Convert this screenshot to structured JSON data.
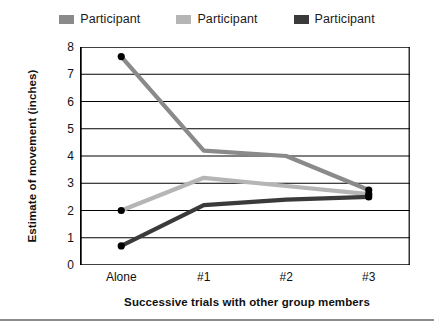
{
  "chart_data": {
    "type": "line",
    "title": "",
    "xlabel": "Successive trials with other group members",
    "ylabel": "Estimate of movement (inches)",
    "categories": [
      "Alone",
      "#1",
      "#2",
      "#3"
    ],
    "ylim": [
      0,
      8
    ],
    "yticks": [
      "0",
      "1",
      "2",
      "3",
      "4",
      "5",
      "6",
      "7",
      "8"
    ],
    "grid": true,
    "legend_position": "top",
    "series": [
      {
        "name": "Participant",
        "color": "#8a8a8a",
        "values": [
          7.65,
          4.2,
          4.0,
          2.75
        ],
        "markers": [
          true,
          false,
          false,
          true
        ]
      },
      {
        "name": "Participant",
        "color": "#b5b5b5",
        "values": [
          2.0,
          3.2,
          2.9,
          2.6
        ],
        "markers": [
          true,
          false,
          false,
          true
        ]
      },
      {
        "name": "Participant",
        "color": "#3a3a3a",
        "values": [
          0.7,
          2.2,
          2.4,
          2.5
        ],
        "markers": [
          true,
          false,
          false,
          true
        ]
      }
    ]
  },
  "legend": {
    "entries": [
      {
        "label": "Participant",
        "color": "#8a8a8a"
      },
      {
        "label": "Participant",
        "color": "#b5b5b5"
      },
      {
        "label": "Participant",
        "color": "#3a3a3a"
      }
    ]
  },
  "axes": {
    "y_title": "Estimate of movement (inches)",
    "x_title": "Successive trials with other group members",
    "y_ticks": [
      "8",
      "7",
      "6",
      "5",
      "4",
      "3",
      "2",
      "1",
      "0"
    ],
    "x_ticks": [
      "Alone",
      "#1",
      "#2",
      "#3"
    ]
  }
}
